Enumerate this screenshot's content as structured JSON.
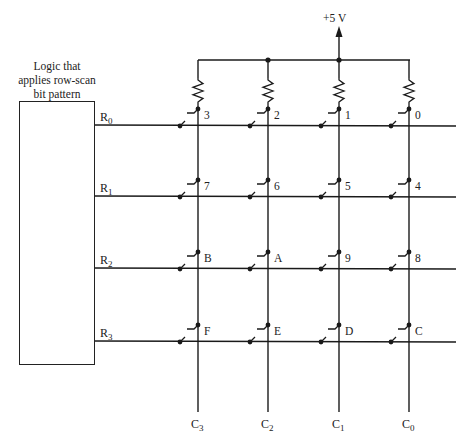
{
  "logic_block": {
    "caption_lines": [
      "Logic that",
      "applies row-scan",
      "bit pattern"
    ]
  },
  "supply": {
    "label": "+5 V"
  },
  "rows": [
    {
      "name": "R",
      "sub": "0",
      "y": 125
    },
    {
      "name": "R",
      "sub": "1",
      "y": 196
    },
    {
      "name": "R",
      "sub": "2",
      "y": 268
    },
    {
      "name": "R",
      "sub": "3",
      "y": 341
    }
  ],
  "columns": [
    {
      "name": "C",
      "sub": "3",
      "x": 198
    },
    {
      "name": "C",
      "sub": "2",
      "x": 268
    },
    {
      "name": "C",
      "sub": "1",
      "x": 339
    },
    {
      "name": "C",
      "sub": "0",
      "x": 409
    }
  ],
  "keys": [
    [
      "3",
      "2",
      "1",
      "0"
    ],
    [
      "7",
      "6",
      "5",
      "4"
    ],
    [
      "B",
      "A",
      "9",
      "8"
    ],
    [
      "F",
      "E",
      "D",
      "C"
    ]
  ],
  "colors": {
    "ink": "#1a1a1a",
    "background": "#ffffff"
  }
}
